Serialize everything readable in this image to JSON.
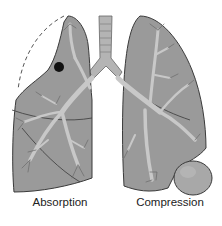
{
  "diagram": {
    "labels": {
      "left": "Absorption",
      "right": "Compression"
    },
    "colors": {
      "lung_fill": "#9a9a9a",
      "lung_outline": "#3a3a3a",
      "airway": "#c8c8c8",
      "airway_outline": "#6a6a6a",
      "trachea": "#b0b0b0",
      "mass_fill": "#a8a8a8",
      "obstruction": "#111111",
      "dashed_outline": "#555555",
      "background": "#ffffff"
    }
  }
}
